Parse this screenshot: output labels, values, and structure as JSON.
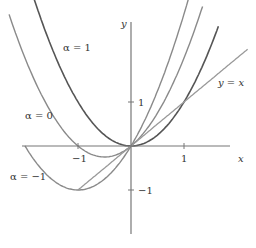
{
  "chart_data": {
    "type": "line",
    "title": "",
    "xlabel": "x",
    "ylabel": "y",
    "xlim": [
      -2.4,
      2.3
    ],
    "ylim": [
      -2.3,
      3.3
    ],
    "grid": false,
    "x_ticks": [
      {
        "value": -1,
        "label": "-1"
      },
      {
        "value": 1,
        "label": "1"
      }
    ],
    "y_ticks": [
      {
        "value": -1,
        "label": "-1"
      },
      {
        "value": 1,
        "label": "1"
      }
    ],
    "series": [
      {
        "name": "α = 1",
        "formula": "y = x^2",
        "color": "#555555",
        "x_range": [
          -2.1,
          1.65
        ]
      },
      {
        "name": "α = 0",
        "formula": "y = x^2 + x",
        "color": "#8a8a8a",
        "x_range": [
          -2.3,
          1.35
        ]
      },
      {
        "name": "α = -1",
        "formula": "y = x^2 + 2x",
        "color": "#8a8a8a",
        "x_range": [
          -2.0,
          1.1
        ]
      },
      {
        "name": "y = x",
        "formula": "y = x",
        "color": "#999999",
        "x_range": [
          -1.0,
          2.2
        ]
      }
    ],
    "annotations": [
      {
        "text": "α = 1",
        "x": -0.95,
        "y": 2.6
      },
      {
        "text": "α = 0",
        "x": -2.0,
        "y": 1.0
      },
      {
        "text": "α = −1",
        "x": -2.4,
        "y": -0.7
      },
      {
        "text": "y = x",
        "x": 1.35,
        "y": 1.2
      }
    ]
  },
  "labels": {
    "x_axis": "x",
    "y_axis": "y",
    "tick_x_neg1": "−1",
    "tick_x_pos1": "1",
    "tick_y_pos1": "1",
    "tick_y_neg1": "−1",
    "alpha1": "α = 1",
    "alpha0": "α = 0",
    "alphaNeg1": "α = −1",
    "yx": "y = x"
  }
}
